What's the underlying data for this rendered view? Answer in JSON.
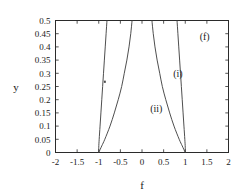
{
  "chart_data": {
    "type": "line",
    "title": "",
    "subtitle": "",
    "xlabel": "f",
    "ylabel": "y",
    "xlim": [
      -2,
      2
    ],
    "ylim": [
      0,
      0.5
    ],
    "grid": false,
    "legend_position": "inline-annotations",
    "panel_label": "(f)",
    "xticks": [
      "-2",
      "-1.5",
      "-1",
      "-0.5",
      "0",
      "0.5",
      "1",
      "1.5",
      "2"
    ],
    "xtick_values": [
      -2,
      -1.5,
      -1,
      -0.5,
      0,
      0.5,
      1,
      1.5,
      2
    ],
    "yticks": [
      "0",
      "0.05",
      "0.1",
      "0.15",
      "0.2",
      "0.25",
      "0.3",
      "0.35",
      "0.4",
      "0.45",
      "0.5"
    ],
    "ytick_values": [
      0,
      0.05,
      0.1,
      0.15,
      0.2,
      0.25,
      0.3,
      0.35,
      0.4,
      0.45,
      0.5
    ],
    "annotations": [
      {
        "text": "(f)",
        "x": 1.45,
        "y": 0.425
      },
      {
        "text": "(i)",
        "x": 0.83,
        "y": 0.285
      },
      {
        "text": "(ii)",
        "x": 0.33,
        "y": 0.155
      }
    ],
    "series": [
      {
        "name": "(i) right branch",
        "label": "(i)",
        "color": "#3a3a3a",
        "points": [
          {
            "x": 1.0,
            "y": 0.0
          },
          {
            "x": 1.0,
            "y": 0.02
          },
          {
            "x": 0.99,
            "y": 0.05
          },
          {
            "x": 0.97,
            "y": 0.1
          },
          {
            "x": 0.95,
            "y": 0.15
          },
          {
            "x": 0.93,
            "y": 0.2
          },
          {
            "x": 0.91,
            "y": 0.25
          },
          {
            "x": 0.89,
            "y": 0.3
          },
          {
            "x": 0.87,
            "y": 0.35
          },
          {
            "x": 0.85,
            "y": 0.4
          },
          {
            "x": 0.83,
            "y": 0.45
          },
          {
            "x": 0.81,
            "y": 0.5
          }
        ]
      },
      {
        "name": "(i) left branch",
        "label": "(i)",
        "color": "#3a3a3a",
        "points": [
          {
            "x": -1.0,
            "y": 0.0
          },
          {
            "x": -1.0,
            "y": 0.02
          },
          {
            "x": -0.99,
            "y": 0.05
          },
          {
            "x": -0.97,
            "y": 0.1
          },
          {
            "x": -0.95,
            "y": 0.15
          },
          {
            "x": -0.93,
            "y": 0.2
          },
          {
            "x": -0.91,
            "y": 0.25
          },
          {
            "x": -0.89,
            "y": 0.3
          },
          {
            "x": -0.87,
            "y": 0.35
          },
          {
            "x": -0.85,
            "y": 0.4
          },
          {
            "x": -0.83,
            "y": 0.45
          },
          {
            "x": -0.81,
            "y": 0.5
          }
        ]
      },
      {
        "name": "(ii) right branch",
        "label": "(ii)",
        "color": "#3a3a3a",
        "points": [
          {
            "x": 1.0,
            "y": 0.0
          },
          {
            "x": 0.93,
            "y": 0.025
          },
          {
            "x": 0.86,
            "y": 0.05
          },
          {
            "x": 0.74,
            "y": 0.1
          },
          {
            "x": 0.64,
            "y": 0.15
          },
          {
            "x": 0.55,
            "y": 0.2
          },
          {
            "x": 0.47,
            "y": 0.25
          },
          {
            "x": 0.41,
            "y": 0.3
          },
          {
            "x": 0.35,
            "y": 0.35
          },
          {
            "x": 0.3,
            "y": 0.4
          },
          {
            "x": 0.26,
            "y": 0.45
          },
          {
            "x": 0.23,
            "y": 0.5
          }
        ]
      },
      {
        "name": "(ii) left branch",
        "label": "(ii)",
        "color": "#3a3a3a",
        "points": [
          {
            "x": -1.0,
            "y": 0.0
          },
          {
            "x": -0.93,
            "y": 0.025
          },
          {
            "x": -0.86,
            "y": 0.05
          },
          {
            "x": -0.74,
            "y": 0.1
          },
          {
            "x": -0.64,
            "y": 0.15
          },
          {
            "x": -0.55,
            "y": 0.2
          },
          {
            "x": -0.47,
            "y": 0.25
          },
          {
            "x": -0.41,
            "y": 0.3
          },
          {
            "x": -0.35,
            "y": 0.35
          },
          {
            "x": -0.3,
            "y": 0.4
          },
          {
            "x": -0.26,
            "y": 0.45
          },
          {
            "x": -0.23,
            "y": 0.5
          }
        ]
      }
    ],
    "markers": [
      {
        "x": -0.86,
        "y": 0.268
      }
    ]
  }
}
